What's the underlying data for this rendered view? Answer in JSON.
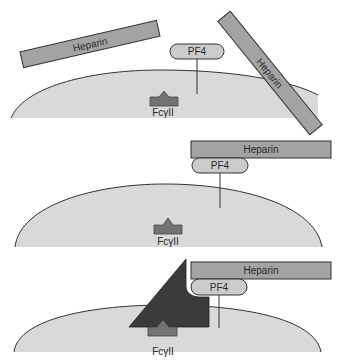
{
  "colors": {
    "cell_fill": "#d9d9d9",
    "heparin_fill": "#a3a3a3",
    "pf4_fill": "#cbcbcb",
    "receptor_fill": "#737373",
    "antibody_fill": "#3b3b3b",
    "stroke": "#333333"
  },
  "panels": [
    {
      "id": "panel-1",
      "description": "Free heparin and PF4 near platelet surface",
      "heparin_labels": [
        "Heparin",
        "Heparin"
      ],
      "pf4_label": "PF4",
      "receptor_label": "FcγII"
    },
    {
      "id": "panel-2",
      "description": "Heparin bound to PF4 complex",
      "heparin_label": "Heparin",
      "pf4_label": "PF4",
      "receptor_label": "FcγII"
    },
    {
      "id": "panel-3",
      "description": "Antibody binding heparin-PF4 complex and FcγII receptor",
      "heparin_label": "Heparin",
      "pf4_label": "PF4",
      "receptor_label": "FcγII"
    }
  ]
}
